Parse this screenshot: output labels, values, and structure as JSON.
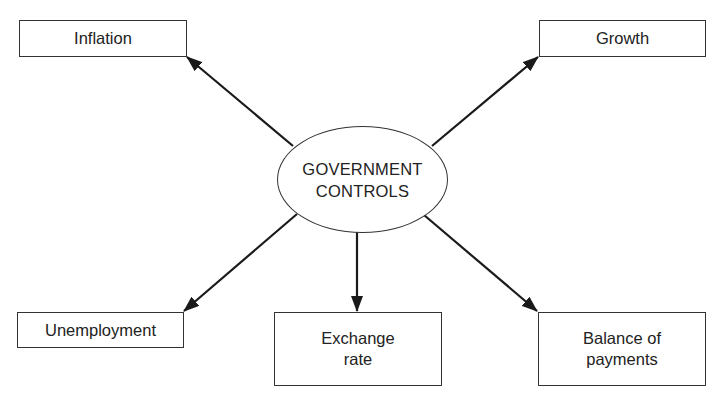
{
  "diagram": {
    "center": {
      "line1": "GOVERNMENT",
      "line2": "CONTROLS"
    },
    "nodes": {
      "inflation": {
        "label": "Inflation"
      },
      "growth": {
        "label": "Growth"
      },
      "unemployment": {
        "label": "Unemployment"
      },
      "exchange_rate": {
        "line1": "Exchange",
        "line2": "rate"
      },
      "balance_of_payments": {
        "line1": "Balance of",
        "line2": "payments"
      }
    },
    "edges": [
      {
        "from": "GOVERNMENT CONTROLS",
        "to": "Inflation"
      },
      {
        "from": "GOVERNMENT CONTROLS",
        "to": "Growth"
      },
      {
        "from": "GOVERNMENT CONTROLS",
        "to": "Unemployment"
      },
      {
        "from": "GOVERNMENT CONTROLS",
        "to": "Exchange rate"
      },
      {
        "from": "GOVERNMENT CONTROLS",
        "to": "Balance of payments"
      }
    ],
    "colors": {
      "stroke": "#222222",
      "background": "#ffffff"
    }
  }
}
